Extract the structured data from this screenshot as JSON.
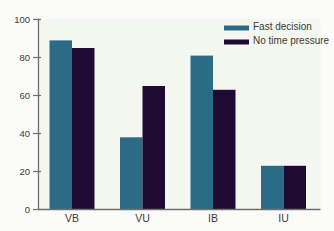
{
  "figure": {
    "background": "#fbfcf9",
    "plot_background": "#f4f6f0",
    "axis_color": "#6f6f6f",
    "text_color": "#3a3a3a"
  },
  "chart_data": {
    "type": "bar",
    "title": "",
    "xlabel": "",
    "ylabel": "",
    "categories": [
      "VB",
      "VU",
      "IB",
      "IU"
    ],
    "series": [
      {
        "name": "Fast decision",
        "color": "#2c6b85",
        "values": [
          89,
          38,
          81,
          23
        ]
      },
      {
        "name": "No time pressure",
        "color": "#1f0a33",
        "values": [
          85,
          65,
          63,
          23
        ]
      }
    ],
    "ylim": [
      0,
      100
    ],
    "yticks": [
      0,
      20,
      40,
      60,
      80,
      100
    ],
    "grid": false,
    "legend_position": "top-right"
  }
}
